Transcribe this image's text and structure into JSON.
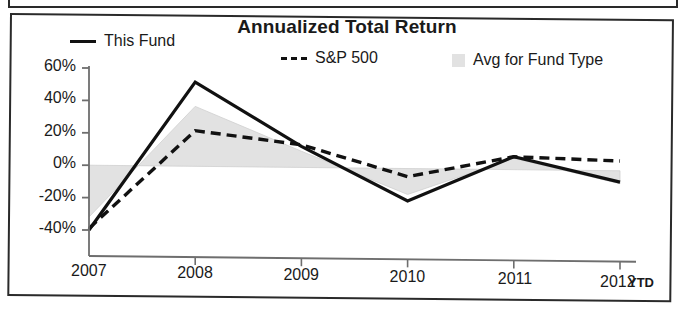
{
  "chart_data": {
    "type": "line",
    "title": "Annualized Total Return",
    "xlabel": "",
    "ylabel": "",
    "categories": [
      "2007",
      "2008",
      "2009",
      "2010",
      "2011",
      "2012"
    ],
    "x_note": "YTD",
    "ylim": [
      -40,
      60
    ],
    "yticks": [
      60,
      40,
      20,
      0,
      -20,
      -40
    ],
    "ytick_labels": [
      "60%",
      "40%",
      "20%",
      "0%",
      "-20%",
      "-40%"
    ],
    "grid": false,
    "legend_position": "top",
    "series": [
      {
        "name": "This Fund",
        "style": "solid",
        "color": "#111111",
        "values": [
          -40,
          52,
          13,
          -20,
          8,
          -7
        ]
      },
      {
        "name": "S&P 500",
        "style": "dashed",
        "color": "#111111",
        "values": [
          -39,
          22,
          14,
          -5,
          8,
          6
        ]
      },
      {
        "name": "Avg for Fund Type",
        "style": "area",
        "color": "#e2e2e2",
        "values": [
          -32,
          37,
          10,
          -16,
          7,
          -8
        ]
      }
    ]
  },
  "chart": {
    "title": "Annualized Total Return",
    "legend": [
      {
        "label": "This Fund",
        "marker": "solid-line-swatch"
      },
      {
        "label": "S&P 500",
        "marker": "dashed-line-swatch"
      },
      {
        "label": "Avg for Fund Type",
        "marker": "area-swatch"
      }
    ],
    "y_axis": {
      "labels": [
        "60%",
        "40%",
        "20%",
        "0%",
        "-20%",
        "-40%"
      ]
    },
    "x_axis": {
      "labels": [
        "2007",
        "2008",
        "2009",
        "2010",
        "2011",
        "2012"
      ],
      "suffix": "YTD"
    },
    "colors": {
      "line": "#111111",
      "area_fill": "#e2e2e2",
      "axis": "#6e6e6e",
      "border": "#2a2a2a"
    }
  }
}
